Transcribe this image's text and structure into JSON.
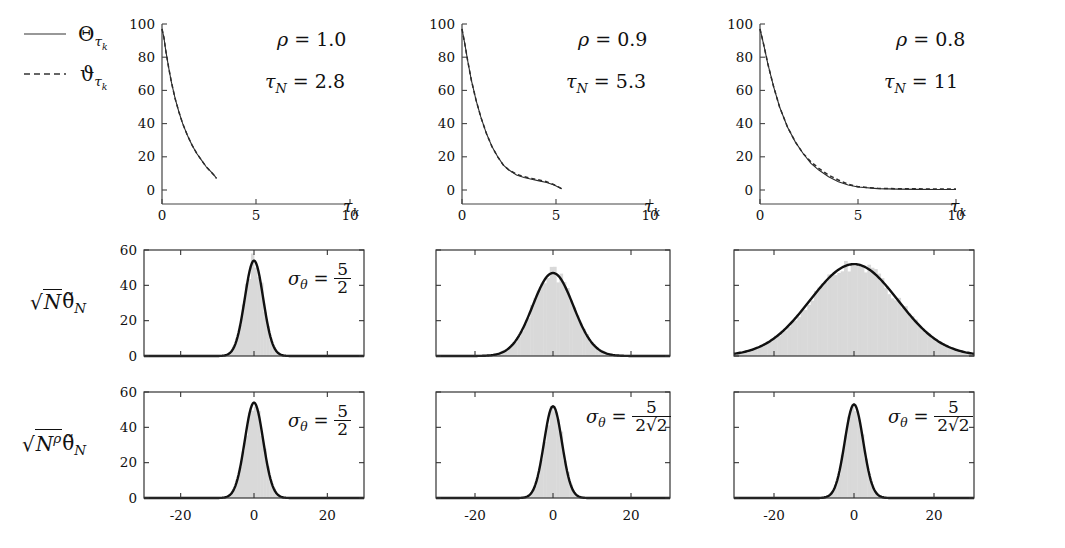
{
  "figure": {
    "legend": [
      {
        "style": "solid",
        "label": "Θ",
        "sub": "τ",
        "subsub": "k",
        "name": "theta-capital-tau-k"
      },
      {
        "style": "dashed",
        "label": "ϑ",
        "sub": "τ",
        "subsub": "k",
        "name": "vartheta-tau-k"
      }
    ],
    "row_labels": [
      {
        "id": "row1",
        "text": ""
      },
      {
        "id": "row2",
        "text": "√N θ̃_N"
      },
      {
        "id": "row3",
        "text": "√(N^ρ) θ̃_N"
      }
    ],
    "columns": [
      {
        "rho_label": "ρ = 1.0",
        "rho": "1.0",
        "tau_label": "τ_N = 2.8",
        "tau_N": "2.8"
      },
      {
        "rho_label": "ρ = 0.9",
        "rho": "0.9",
        "tau_label": "τ_N = 5.3",
        "tau_N": "5.3"
      },
      {
        "rho_label": "ρ = 0.8",
        "rho": "0.8",
        "tau_label": "τ_N = 11",
        "tau_N": "11"
      }
    ],
    "sigma_annotations": {
      "row2": [
        {
          "shown": true,
          "num": "5",
          "den": "2"
        },
        {
          "shown": false,
          "num": "",
          "den": ""
        },
        {
          "shown": false,
          "num": "",
          "den": ""
        }
      ],
      "row3": [
        {
          "shown": true,
          "num": "5",
          "den": "2"
        },
        {
          "shown": true,
          "num": "5",
          "den": "2√2"
        },
        {
          "shown": true,
          "num": "5",
          "den": "2√2"
        }
      ]
    },
    "sigma_symbol": "σ",
    "sigma_sub": "θ",
    "equals": "="
  },
  "chart_data": [
    {
      "id": "decay-rho-1.0",
      "type": "line",
      "title": "ρ = 1.0, τ_N = 2.8",
      "xlabel": "τ_k",
      "ylabel": "",
      "xlim": [
        0,
        10
      ],
      "ylim": [
        0,
        100
      ],
      "xticks": [
        0,
        5,
        10
      ],
      "xticklabels": [
        "0",
        "5",
        "10"
      ],
      "yticks": [
        0,
        20,
        40,
        60,
        80,
        100
      ],
      "yticklabels": [
        "0",
        "20",
        "40",
        "60",
        "80",
        "100"
      ],
      "grid": false,
      "legend_position": "outside-left",
      "series": [
        {
          "name": "Θ",
          "style": "solid",
          "x": [
            0,
            0.1,
            0.2,
            0.35,
            0.5,
            0.7,
            0.9,
            1.1,
            1.35,
            1.6,
            1.85,
            2.1,
            2.35,
            2.6,
            2.8,
            2.9
          ],
          "y": [
            97,
            92,
            84,
            74,
            65,
            55,
            47,
            40,
            33,
            27,
            22,
            18,
            14,
            11,
            8.5,
            7
          ]
        },
        {
          "name": "ϑ",
          "style": "dashed",
          "x": [
            0,
            0.1,
            0.2,
            0.35,
            0.5,
            0.7,
            0.9,
            1.1,
            1.35,
            1.6,
            1.85,
            2.1,
            2.35,
            2.6,
            2.8,
            2.9
          ],
          "y": [
            97,
            92,
            84,
            74,
            65,
            55,
            47,
            40,
            33,
            27,
            22,
            18,
            14,
            11,
            8.5,
            7
          ]
        }
      ]
    },
    {
      "id": "decay-rho-0.9",
      "type": "line",
      "title": "ρ = 0.9, τ_N = 5.3",
      "xlabel": "τ_k",
      "ylabel": "",
      "xlim": [
        0,
        10
      ],
      "ylim": [
        0,
        100
      ],
      "xticks": [
        0,
        5,
        10
      ],
      "xticklabels": [
        "0",
        "5",
        "10"
      ],
      "yticks": [
        0,
        20,
        40,
        60,
        80,
        100
      ],
      "yticklabels": [
        "0",
        "20",
        "40",
        "60",
        "80",
        "100"
      ],
      "grid": false,
      "legend_position": "none",
      "series": [
        {
          "name": "Θ",
          "style": "solid",
          "x": [
            0,
            0.15,
            0.3,
            0.5,
            0.75,
            1.0,
            1.3,
            1.6,
            1.9,
            2.2,
            2.5,
            2.9,
            3.3,
            3.7,
            4.1,
            4.5,
            4.9,
            5.3
          ],
          "y": [
            97,
            88,
            78,
            66,
            54,
            44,
            34,
            26,
            20,
            15,
            12,
            9,
            7.5,
            6.5,
            5.5,
            4.5,
            3,
            0.8
          ]
        },
        {
          "name": "ϑ",
          "style": "dashed",
          "x": [
            0,
            0.15,
            0.3,
            0.5,
            0.75,
            1.0,
            1.3,
            1.6,
            1.9,
            2.2,
            2.5,
            2.9,
            3.3,
            3.7,
            4.1,
            4.5,
            4.9,
            5.3
          ],
          "y": [
            97,
            88,
            78,
            66,
            54,
            44,
            34,
            26,
            20,
            15,
            12,
            9.5,
            8,
            7,
            6,
            5,
            3.2,
            0.8
          ]
        }
      ]
    },
    {
      "id": "decay-rho-0.8",
      "type": "line",
      "title": "ρ = 0.8, τ_N = 11",
      "xlabel": "τ_k",
      "ylabel": "",
      "xlim": [
        0,
        10
      ],
      "ylim": [
        0,
        100
      ],
      "xticks": [
        0,
        5,
        10
      ],
      "xticklabels": [
        "0",
        "5",
        "10"
      ],
      "yticks": [
        0,
        20,
        40,
        60,
        80,
        100
      ],
      "yticklabels": [
        "0",
        "20",
        "40",
        "60",
        "80",
        "100"
      ],
      "grid": false,
      "legend_position": "none",
      "series": [
        {
          "name": "Θ",
          "style": "solid",
          "x": [
            0,
            0.2,
            0.4,
            0.7,
            1.0,
            1.4,
            1.8,
            2.2,
            2.6,
            3.0,
            3.5,
            4.0,
            4.5,
            5.0,
            6.0,
            7.0,
            8.0,
            9.0,
            10.0
          ],
          "y": [
            97,
            87,
            76,
            62,
            50,
            38,
            29,
            22,
            16,
            12,
            8,
            5,
            3,
            1.8,
            0.8,
            0.5,
            0.4,
            0.3,
            0.3
          ]
        },
        {
          "name": "ϑ",
          "style": "dashed",
          "x": [
            0,
            0.2,
            0.4,
            0.7,
            1.0,
            1.4,
            1.8,
            2.2,
            2.6,
            3.0,
            3.5,
            4.0,
            4.5,
            5.0,
            6.0,
            7.0,
            8.0,
            9.0,
            10.0
          ],
          "y": [
            97,
            87,
            76,
            62,
            50,
            38,
            29,
            22,
            17,
            13,
            9,
            6,
            3.5,
            2.0,
            1.0,
            0.8,
            0.7,
            0.6,
            0.6
          ]
        }
      ]
    },
    {
      "id": "hist-sqrtN-rho-1.0",
      "type": "area",
      "title": "√N θ̃_N, ρ = 1.0",
      "xlabel": "",
      "ylabel": "",
      "xlim": [
        -30,
        30
      ],
      "ylim": [
        0,
        60
      ],
      "xticks": [
        -20,
        0,
        20
      ],
      "xticklabels": [
        "",
        "",
        ""
      ],
      "yticks": [
        0,
        20,
        40,
        60
      ],
      "yticklabels": [
        "0",
        "20",
        "40",
        "60"
      ],
      "grid": false,
      "legend_position": "none",
      "distribution": {
        "mean": 0,
        "sigma": 2.5,
        "peak": 54,
        "sigma_label_num": "5",
        "sigma_label_den": "2"
      }
    },
    {
      "id": "hist-sqrtN-rho-0.9",
      "type": "area",
      "title": "√N θ̃_N, ρ = 0.9",
      "xlabel": "",
      "ylabel": "",
      "xlim": [
        -30,
        30
      ],
      "ylim": [
        0,
        60
      ],
      "xticks": [
        -20,
        0,
        20
      ],
      "xticklabels": [
        "",
        "",
        ""
      ],
      "yticks": [
        0,
        20,
        40,
        60
      ],
      "yticklabels": [
        "",
        "",
        "",
        ""
      ],
      "grid": false,
      "legend_position": "none",
      "distribution": {
        "mean": 0,
        "sigma": 5.2,
        "peak": 47,
        "sigma_label_num": "",
        "sigma_label_den": ""
      }
    },
    {
      "id": "hist-sqrtN-rho-0.8",
      "type": "area",
      "title": "√N θ̃_N, ρ = 0.8",
      "xlabel": "",
      "ylabel": "",
      "xlim": [
        -30,
        30
      ],
      "ylim": [
        0,
        60
      ],
      "xticks": [
        -20,
        0,
        20
      ],
      "xticklabels": [
        "",
        "",
        ""
      ],
      "yticks": [
        0,
        20,
        40,
        60
      ],
      "yticklabels": [
        "",
        "",
        "",
        ""
      ],
      "grid": false,
      "legend_position": "none",
      "distribution": {
        "mean": 0,
        "sigma": 11.0,
        "peak": 52,
        "sigma_label_num": "",
        "sigma_label_den": ""
      }
    },
    {
      "id": "hist-sqrtNrho-rho-1.0",
      "type": "area",
      "title": "√(N^ρ) θ̃_N, ρ = 1.0",
      "xlabel": "",
      "ylabel": "",
      "xlim": [
        -30,
        30
      ],
      "ylim": [
        0,
        60
      ],
      "xticks": [
        -20,
        0,
        20
      ],
      "xticklabels": [
        "-20",
        "0",
        "20"
      ],
      "yticks": [
        0,
        20,
        40,
        60
      ],
      "yticklabels": [
        "0",
        "20",
        "40",
        "60"
      ],
      "grid": false,
      "legend_position": "none",
      "distribution": {
        "mean": 0,
        "sigma": 2.5,
        "peak": 54,
        "sigma_label_num": "5",
        "sigma_label_den": "2"
      }
    },
    {
      "id": "hist-sqrtNrho-rho-0.9",
      "type": "area",
      "title": "√(N^ρ) θ̃_N, ρ = 0.9",
      "xlabel": "",
      "ylabel": "",
      "xlim": [
        -30,
        30
      ],
      "ylim": [
        0,
        60
      ],
      "xticks": [
        -20,
        0,
        20
      ],
      "xticklabels": [
        "-20",
        "0",
        "20"
      ],
      "yticks": [
        0,
        20,
        40,
        60
      ],
      "yticklabels": [
        "",
        "",
        "",
        ""
      ],
      "grid": false,
      "legend_position": "none",
      "distribution": {
        "mean": 0,
        "sigma": 2.3,
        "peak": 52,
        "sigma_label_num": "5",
        "sigma_label_den": "2√2"
      }
    },
    {
      "id": "hist-sqrtNrho-rho-0.8",
      "type": "area",
      "title": "√(N^ρ) θ̃_N, ρ = 0.8",
      "xlabel": "",
      "ylabel": "",
      "xlim": [
        -30,
        30
      ],
      "ylim": [
        0,
        60
      ],
      "xticks": [
        -20,
        0,
        20
      ],
      "xticklabels": [
        "-20",
        "0",
        "20"
      ],
      "yticks": [
        0,
        20,
        40,
        60
      ],
      "yticklabels": [
        "",
        "",
        "",
        ""
      ],
      "grid": false,
      "legend_position": "none",
      "distribution": {
        "mean": 0,
        "sigma": 2.3,
        "peak": 53,
        "sigma_label_num": "5",
        "sigma_label_den": "2√2"
      }
    }
  ]
}
